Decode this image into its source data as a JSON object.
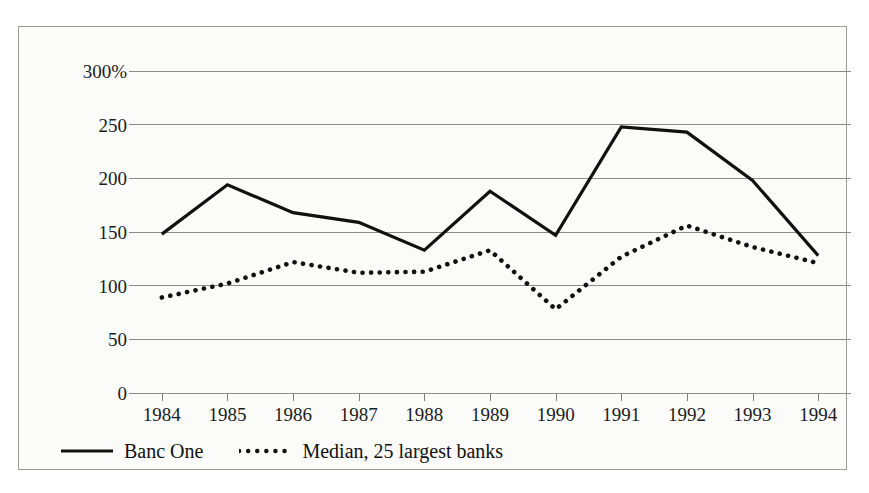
{
  "figure": {
    "background_color": "#fbfbfa",
    "border_color": "#9a9a9a",
    "title_remnant": "·"
  },
  "legend": {
    "position": "bottom-left",
    "entries": [
      {
        "label": "Banc One",
        "style": "solid",
        "color": "#111111",
        "swatch_icon": "solid-line-icon"
      },
      {
        "label": "Median, 25 largest banks",
        "style": "dotted",
        "color": "#111111",
        "swatch_icon": "dotted-line-icon"
      }
    ]
  },
  "chart_data": {
    "type": "line",
    "title": "",
    "subtitle": "",
    "xlabel": "",
    "ylabel": "",
    "x": [
      "1984",
      "1985",
      "1986",
      "1987",
      "1988",
      "1989",
      "1990",
      "1991",
      "1992",
      "1993",
      "1994"
    ],
    "categories": [
      "1984",
      "1985",
      "1986",
      "1987",
      "1988",
      "1989",
      "1990",
      "1991",
      "1992",
      "1993",
      "1994"
    ],
    "ylim": [
      0,
      300
    ],
    "yticks": [
      0,
      50,
      100,
      150,
      200,
      250,
      300
    ],
    "ytick_labels": [
      "0",
      "50",
      "100",
      "150",
      "200",
      "250",
      "300%"
    ],
    "grid": true,
    "grid_color": "#8c8c8c",
    "legend_position": "bottom-left",
    "series": [
      {
        "name": "Banc One",
        "style": "solid",
        "color": "#111111",
        "values": [
          148,
          194,
          168,
          159,
          133,
          188,
          147,
          248,
          243,
          198,
          128
        ]
      },
      {
        "name": "Median, 25 largest banks",
        "style": "dotted",
        "color": "#111111",
        "values": [
          89,
          102,
          122,
          112,
          113,
          133,
          78,
          127,
          156,
          136,
          121
        ]
      }
    ]
  }
}
